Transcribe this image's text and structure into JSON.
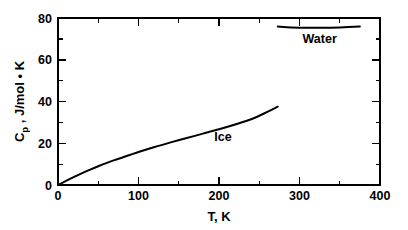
{
  "figure": {
    "background_color": "#ffffff",
    "line_color": "#000000"
  },
  "axes": {
    "x": {
      "title": "T, K",
      "tick_labels": [
        "0",
        "100",
        "200",
        "300",
        "400"
      ],
      "tick_values": [
        0,
        100,
        200,
        300,
        400
      ],
      "minor_tick_values": [
        50,
        150,
        250,
        350
      ],
      "range": [
        0,
        400
      ]
    },
    "y": {
      "title_main": "C",
      "title_sub": "p",
      "title_rest": " , J/mol • K",
      "tick_labels": [
        "0",
        "20",
        "40",
        "60",
        "80"
      ],
      "tick_values": [
        0,
        20,
        40,
        60,
        80
      ],
      "minor_tick_values": [
        10,
        30,
        50,
        70
      ],
      "range": [
        0,
        80
      ]
    }
  },
  "series_labels": {
    "ice": "Ice",
    "water": "Water"
  },
  "chart_data": {
    "type": "line",
    "title": "",
    "xlabel": "T, K",
    "ylabel": "Cp , J/mol • K",
    "xlim": [
      0,
      400
    ],
    "ylim": [
      0,
      80
    ],
    "grid": false,
    "legend": "inline-annotations",
    "xticks": [
      0,
      100,
      200,
      300,
      400
    ],
    "yticks": [
      0,
      20,
      40,
      60,
      80
    ],
    "xticks_minor": [
      50,
      150,
      250,
      350
    ],
    "yticks_minor": [
      10,
      30,
      50,
      70
    ],
    "series": [
      {
        "name": "Ice",
        "label_position": {
          "x": 205,
          "y": 21
        },
        "x": [
          0,
          10,
          20,
          30,
          40,
          50,
          60,
          70,
          80,
          90,
          100,
          120,
          140,
          160,
          180,
          200,
          220,
          240,
          260,
          273
        ],
        "values": [
          0,
          2.0,
          3.9,
          5.7,
          7.4,
          9.0,
          10.5,
          11.9,
          13.2,
          14.5,
          15.8,
          18.2,
          20.4,
          22.5,
          24.6,
          26.7,
          29.0,
          31.5,
          35.0,
          37.5
        ]
      },
      {
        "name": "Water",
        "label_position": {
          "x": 325,
          "y": 68
        },
        "x": [
          273,
          290,
          310,
          330,
          350,
          375
        ],
        "values": [
          75.9,
          75.5,
          75.3,
          75.3,
          75.5,
          75.9
        ]
      }
    ]
  }
}
